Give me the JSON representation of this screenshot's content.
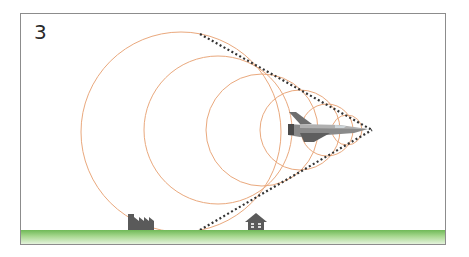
{
  "figure": {
    "panel_label": "3",
    "colors": {
      "wavefront": "#e8a070",
      "cone_line": "#333333",
      "ground_top": "#7cc063",
      "ground_bottom": "#d6ecc9",
      "building": "#5a5a5a",
      "frame": "#8c8c8c"
    },
    "elements": {
      "aircraft": "fighter-jet",
      "ground_objects": [
        "factory",
        "house"
      ],
      "wavefront_count": 6
    }
  }
}
